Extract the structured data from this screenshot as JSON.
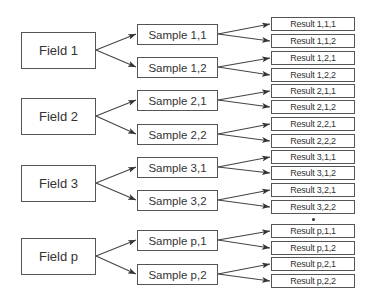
{
  "diagram": {
    "type": "hierarchy",
    "levels": [
      "Field",
      "Sample",
      "Result"
    ],
    "groups": [
      {
        "field": "Field 1",
        "samples": [
          {
            "label": "Sample 1,1",
            "results": [
              "Result 1,1,1",
              "Result 1,1,2"
            ]
          },
          {
            "label": "Sample 1,2",
            "results": [
              "Result 1,2,1",
              "Result 1,2,2"
            ]
          }
        ]
      },
      {
        "field": "Field 2",
        "samples": [
          {
            "label": "Sample 2,1",
            "results": [
              "Result 2,1,1",
              "Result 2,1,2"
            ]
          },
          {
            "label": "Sample 2,2",
            "results": [
              "Result 2,2,1",
              "Result 2,2,2"
            ]
          }
        ]
      },
      {
        "field": "Field 3",
        "samples": [
          {
            "label": "Sample 3,1",
            "results": [
              "Result 3,1,1",
              "Result 3,1,2"
            ]
          },
          {
            "label": "Sample 3,2",
            "results": [
              "Result 3,2,1",
              "Result 3,2,2"
            ]
          }
        ]
      },
      {
        "field": "Field p",
        "samples": [
          {
            "label": "Sample p,1",
            "results": [
              "Result p,1,1",
              "Result p,1,2"
            ]
          },
          {
            "label": "Sample p,2",
            "results": [
              "Result p,2,1",
              "Result p,2,2"
            ]
          }
        ]
      }
    ],
    "ellipsis": "•",
    "colors": {
      "stroke": "#555555",
      "text": "#333333",
      "background": "#ffffff"
    }
  }
}
